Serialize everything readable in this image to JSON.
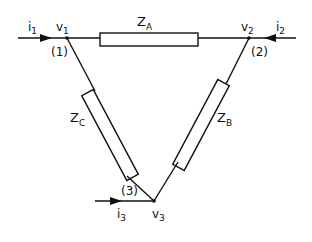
{
  "diagram": {
    "type": "delta impedance network",
    "impedances": [
      {
        "name": "Z",
        "sub": "A",
        "between": [
          "v1",
          "v2"
        ]
      },
      {
        "name": "Z",
        "sub": "B",
        "between": [
          "v2",
          "v3"
        ]
      },
      {
        "name": "Z",
        "sub": "C",
        "between": [
          "v1",
          "v3"
        ]
      }
    ],
    "nodes": [
      {
        "voltage": "v",
        "sub": "1",
        "index": "(1)"
      },
      {
        "voltage": "v",
        "sub": "2",
        "index": "(2)"
      },
      {
        "voltage": "v",
        "sub": "3",
        "index": "(3)"
      }
    ],
    "currents": [
      {
        "name": "i",
        "sub": "1"
      },
      {
        "name": "i",
        "sub": "2"
      },
      {
        "name": "i",
        "sub": "3"
      }
    ]
  }
}
